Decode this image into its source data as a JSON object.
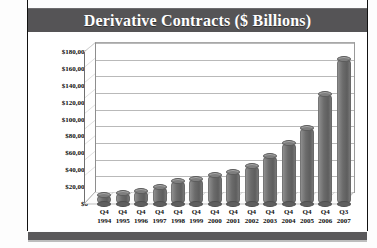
{
  "chart_data": {
    "type": "bar",
    "title": "Derivative Contracts ($ Billions)",
    "xlabel": "",
    "ylabel": "",
    "ylim": [
      0,
      180000
    ],
    "ytick_step": 20000,
    "yticks": [
      "$180,000",
      "$160,000",
      "$140,000",
      "$120,000",
      "$100,000",
      "$80,000",
      "$60,000",
      "$40,000",
      "$20,000",
      "$0"
    ],
    "ytick_values": [
      180000,
      160000,
      140000,
      120000,
      100000,
      80000,
      60000,
      40000,
      20000,
      0
    ],
    "grid": true,
    "legend": "none",
    "style": "3d-cylinder",
    "categories": [
      "Q4 1994",
      "Q4 1995",
      "Q4 1996",
      "Q4 1997",
      "Q4 1998",
      "Q4 1999",
      "Q4 2000",
      "Q4 2001",
      "Q4 2002",
      "Q4 2003",
      "Q4 2004",
      "Q4 2005",
      "Q4 2006",
      "Q3 2007"
    ],
    "category_lines": [
      {
        "q": "Q4",
        "y": "1994"
      },
      {
        "q": "Q4",
        "y": "1995"
      },
      {
        "q": "Q4",
        "y": "1996"
      },
      {
        "q": "Q4",
        "y": "1997"
      },
      {
        "q": "Q4",
        "y": "1998"
      },
      {
        "q": "Q4",
        "y": "1999"
      },
      {
        "q": "Q4",
        "y": "2000"
      },
      {
        "q": "Q4",
        "y": "2001"
      },
      {
        "q": "Q4",
        "y": "2002"
      },
      {
        "q": "Q4",
        "y": "2003"
      },
      {
        "q": "Q4",
        "y": "2004"
      },
      {
        "q": "Q4",
        "y": "2005"
      },
      {
        "q": "Q4",
        "y": "2006"
      },
      {
        "q": "Q3",
        "y": "2007"
      }
    ],
    "values": [
      11000,
      13000,
      15000,
      20000,
      27000,
      30000,
      34000,
      38000,
      45000,
      57000,
      72000,
      90000,
      130000,
      172000
    ],
    "colors": {
      "bar": "#6b6b6b",
      "banner": "#555456",
      "title_text": "#ffffff",
      "grid": "#b9b9b9",
      "axis": "#6f6f6f",
      "background": "#ffffff",
      "bottom_strip": "#5a595b"
    }
  }
}
